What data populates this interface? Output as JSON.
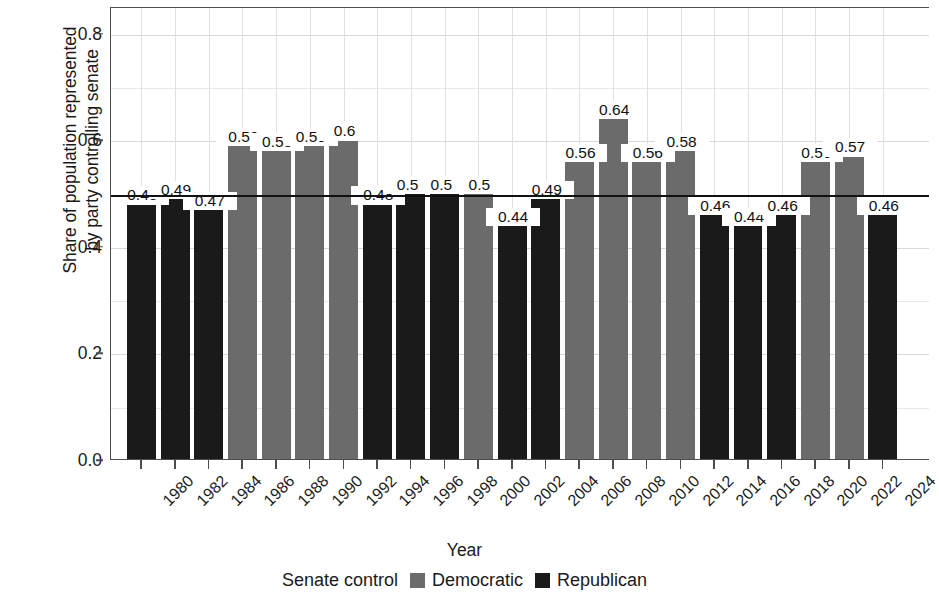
{
  "chart_data": {
    "type": "bar",
    "title": "",
    "xlabel": "Year",
    "ylabel": "Share of population represented\nby party controlling senate",
    "ylim": [
      0.0,
      0.85
    ],
    "ytick_values": [
      0.0,
      0.2,
      0.4,
      0.6,
      0.8
    ],
    "ytick_labels": [
      "0.0",
      "0.2",
      "0.4",
      "0.6",
      "0.8"
    ],
    "yminor_values": [
      0.1,
      0.3,
      0.5,
      0.7
    ],
    "grid": true,
    "reference_line": 0.5,
    "legend_position": "bottom",
    "legend_title": "Senate control",
    "categories": [
      "1980",
      "1982",
      "1984",
      "1986",
      "1988",
      "1990",
      "1992",
      "1994",
      "1996",
      "1998",
      "2000",
      "2002",
      "2004",
      "2006",
      "2008",
      "2010",
      "2012",
      "2014",
      "2016",
      "2018",
      "2020",
      "2022",
      "2024"
    ],
    "values": [
      0.48,
      0.49,
      0.47,
      0.59,
      0.58,
      0.59,
      0.6,
      0.48,
      0.5,
      0.5,
      0.5,
      0.44,
      0.49,
      0.56,
      0.64,
      0.56,
      0.58,
      0.46,
      0.44,
      0.46,
      0.56,
      0.57,
      0.46
    ],
    "value_labels": [
      "0.48",
      "0.49",
      "0.47",
      "0.59",
      "0.58",
      "0.59",
      "0.6",
      "0.48",
      "0.50",
      "0.50",
      "0.5",
      "0.44",
      "0.49",
      "0.56",
      "0.64",
      "0.56",
      "0.58",
      "0.46",
      "0.44",
      "0.46",
      "0.56",
      "0.57",
      "0.46"
    ],
    "groups": [
      "Republican",
      "Republican",
      "Republican",
      "Democratic",
      "Democratic",
      "Democratic",
      "Democratic",
      "Republican",
      "Republican",
      "Republican",
      "Democratic",
      "Republican",
      "Republican",
      "Democratic",
      "Democratic",
      "Democratic",
      "Democratic",
      "Republican",
      "Republican",
      "Republican",
      "Democratic",
      "Democratic",
      "Republican"
    ],
    "series": [
      {
        "name": "Democratic",
        "color": "#6b6b6b",
        "points": [
          {
            "x": "1986",
            "y": 0.59
          },
          {
            "x": "1988",
            "y": 0.58
          },
          {
            "x": "1990",
            "y": 0.59
          },
          {
            "x": "1992",
            "y": 0.6
          },
          {
            "x": "2000",
            "y": 0.5
          },
          {
            "x": "2006",
            "y": 0.56
          },
          {
            "x": "2008",
            "y": 0.64
          },
          {
            "x": "2010",
            "y": 0.56
          },
          {
            "x": "2012",
            "y": 0.58
          },
          {
            "x": "2020",
            "y": 0.56
          },
          {
            "x": "2022",
            "y": 0.57
          }
        ]
      },
      {
        "name": "Republican",
        "color": "#1a1a1a",
        "points": [
          {
            "x": "1980",
            "y": 0.48
          },
          {
            "x": "1982",
            "y": 0.49
          },
          {
            "x": "1984",
            "y": 0.47
          },
          {
            "x": "1994",
            "y": 0.48
          },
          {
            "x": "1996",
            "y": 0.5
          },
          {
            "x": "1998",
            "y": 0.5
          },
          {
            "x": "2002",
            "y": 0.44
          },
          {
            "x": "2004",
            "y": 0.49
          },
          {
            "x": "2014",
            "y": 0.46
          },
          {
            "x": "2016",
            "y": 0.44
          },
          {
            "x": "2018",
            "y": 0.46
          },
          {
            "x": "2024",
            "y": 0.46
          }
        ]
      }
    ]
  },
  "legend": {
    "title": "Senate control",
    "entries": [
      {
        "label": "Democratic",
        "color": "#6b6b6b"
      },
      {
        "label": "Republican",
        "color": "#1a1a1a"
      }
    ]
  },
  "colors": {
    "democratic": "#6b6b6b",
    "republican": "#1a1a1a",
    "axis": "#4d4d4d",
    "grid": "#d8d8d8",
    "reference_line": "#111111",
    "background": "#ffffff",
    "text": "#1a1a1a"
  }
}
